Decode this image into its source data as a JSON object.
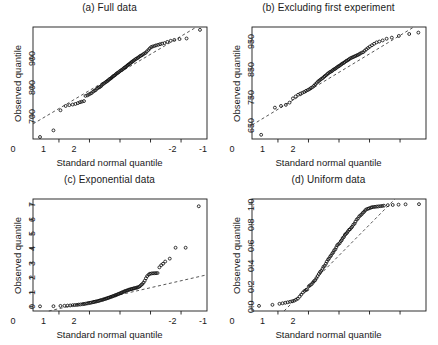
{
  "figure": {
    "width": 438,
    "height": 345,
    "background": "#ffffff",
    "ink_color": "#1a1a1a",
    "point_color": "#111111",
    "line_color": "#444444"
  },
  "chart_data": [
    {
      "id": "panel-a",
      "type": "scatter",
      "title": "(a) Full data",
      "xlabel": "Standard normal quantile",
      "ylabel": "Observed quantile",
      "xticks": [
        -2,
        -1,
        0,
        1,
        2
      ],
      "xticklabels": [
        "-2",
        "-1",
        "0",
        "1",
        "2"
      ],
      "yticks": [
        700,
        800,
        900
      ],
      "yticklabels": [
        "700",
        "800",
        "900"
      ],
      "xlim": [
        -2.85,
        2.85
      ],
      "ylim": [
        620,
        1010
      ],
      "grid": false,
      "legend": null,
      "reference_line": {
        "style": "dashed",
        "intercept": 852,
        "slope": 63
      },
      "x": [
        -2.62,
        -2.18,
        -1.95,
        -1.78,
        -1.66,
        -1.55,
        -1.46,
        -1.38,
        -1.31,
        -1.25,
        -1.18,
        -1.13,
        -1.07,
        -1.02,
        -0.97,
        -0.93,
        -0.88,
        -0.84,
        -0.8,
        -0.76,
        -0.72,
        -0.68,
        -0.65,
        -0.61,
        -0.58,
        -0.54,
        -0.51,
        -0.47,
        -0.44,
        -0.41,
        -0.38,
        -0.35,
        -0.32,
        -0.29,
        -0.26,
        -0.23,
        -0.2,
        -0.17,
        -0.14,
        -0.11,
        -0.08,
        -0.05,
        -0.02,
        0.02,
        0.05,
        0.08,
        0.11,
        0.14,
        0.17,
        0.2,
        0.23,
        0.26,
        0.29,
        0.32,
        0.35,
        0.38,
        0.41,
        0.44,
        0.47,
        0.51,
        0.54,
        0.58,
        0.61,
        0.65,
        0.68,
        0.72,
        0.76,
        0.8,
        0.84,
        0.88,
        0.93,
        0.97,
        1.02,
        1.07,
        1.13,
        1.18,
        1.25,
        1.31,
        1.38,
        1.46,
        1.55,
        1.66,
        1.78,
        1.95,
        2.18,
        2.62
      ],
      "y": [
        627,
        650,
        720,
        735,
        738,
        740,
        742,
        745,
        748,
        750,
        752,
        770,
        772,
        775,
        778,
        780,
        785,
        788,
        790,
        795,
        798,
        800,
        802,
        805,
        810,
        812,
        815,
        818,
        820,
        822,
        825,
        828,
        830,
        832,
        835,
        838,
        840,
        842,
        845,
        848,
        850,
        852,
        855,
        858,
        860,
        862,
        865,
        868,
        870,
        872,
        875,
        878,
        880,
        882,
        885,
        888,
        890,
        892,
        895,
        898,
        900,
        902,
        905,
        908,
        910,
        912,
        915,
        918,
        920,
        925,
        930,
        935,
        940,
        942,
        944,
        946,
        948,
        950,
        952,
        954,
        958,
        962,
        965,
        968,
        970,
        1000
      ]
    },
    {
      "id": "panel-b",
      "type": "scatter",
      "title": "(b) Excluding first experiment",
      "xlabel": "Standard normal quantile",
      "ylabel": "Observed quantile",
      "xticks": [
        -2,
        -1,
        0,
        1,
        2
      ],
      "xticklabels": [
        "-2",
        "-1",
        "0",
        "1",
        "2"
      ],
      "yticks": [
        650,
        750,
        850,
        950
      ],
      "yticklabels": [
        "650",
        "750",
        "850",
        "950"
      ],
      "xlim": [
        -2.85,
        2.85
      ],
      "ylim": [
        600,
        1000
      ],
      "grid": false,
      "legend": null,
      "reference_line": {
        "style": "dashed",
        "intercept": 838,
        "slope": 66
      },
      "x": [
        -2.55,
        -2.1,
        -1.9,
        -1.74,
        -1.62,
        -1.51,
        -1.42,
        -1.34,
        -1.27,
        -1.2,
        -1.14,
        -1.08,
        -1.02,
        -0.97,
        -0.92,
        -0.87,
        -0.82,
        -0.78,
        -0.73,
        -0.69,
        -0.65,
        -0.61,
        -0.57,
        -0.53,
        -0.49,
        -0.46,
        -0.42,
        -0.38,
        -0.35,
        -0.31,
        -0.28,
        -0.24,
        -0.21,
        -0.18,
        -0.14,
        -0.11,
        -0.08,
        -0.04,
        -0.01,
        0.02,
        0.06,
        0.09,
        0.12,
        0.16,
        0.19,
        0.23,
        0.26,
        0.3,
        0.33,
        0.37,
        0.41,
        0.45,
        0.49,
        0.53,
        0.57,
        0.61,
        0.65,
        0.69,
        0.74,
        0.79,
        0.84,
        0.89,
        0.95,
        1.01,
        1.08,
        1.15,
        1.23,
        1.32,
        1.43,
        1.56,
        1.73,
        1.96,
        2.3,
        2.6
      ],
      "y": [
        615,
        712,
        718,
        722,
        730,
        745,
        752,
        758,
        762,
        765,
        768,
        772,
        775,
        778,
        782,
        785,
        790,
        795,
        800,
        805,
        808,
        812,
        815,
        818,
        822,
        825,
        828,
        832,
        835,
        838,
        840,
        842,
        845,
        848,
        850,
        852,
        855,
        858,
        860,
        862,
        865,
        868,
        870,
        872,
        875,
        878,
        880,
        882,
        885,
        888,
        890,
        892,
        894,
        896,
        898,
        900,
        902,
        905,
        908,
        910,
        915,
        920,
        925,
        930,
        935,
        940,
        945,
        948,
        952,
        958,
        962,
        968,
        975,
        980
      ]
    },
    {
      "id": "panel-c",
      "type": "scatter",
      "title": "(c) Exponential data",
      "xlabel": "Standard normal quantile",
      "ylabel": "Observed quantile",
      "xticks": [
        -2,
        -1,
        0,
        1,
        2
      ],
      "xticklabels": [
        "-2",
        "-1",
        "0",
        "1",
        "2"
      ],
      "yticks": [
        0,
        1,
        2,
        3,
        4,
        5,
        6,
        7
      ],
      "yticklabels": [
        "0",
        "1",
        "2",
        "3",
        "4",
        "5",
        "6",
        "7"
      ],
      "xlim": [
        -2.85,
        2.85
      ],
      "ylim": [
        -0.3,
        7.4
      ],
      "grid": false,
      "legend": null,
      "reference_line": {
        "style": "dashed",
        "intercept": 0.82,
        "slope": 0.48
      },
      "x": [
        -2.62,
        -2.18,
        -1.95,
        -1.82,
        -1.72,
        -1.63,
        -1.55,
        -1.48,
        -1.41,
        -1.35,
        -1.29,
        -1.23,
        -1.18,
        -1.13,
        -1.08,
        -1.03,
        -0.98,
        -0.94,
        -0.89,
        -0.85,
        -0.81,
        -0.77,
        -0.73,
        -0.69,
        -0.65,
        -0.61,
        -0.57,
        -0.54,
        -0.5,
        -0.46,
        -0.43,
        -0.39,
        -0.36,
        -0.32,
        -0.29,
        -0.25,
        -0.22,
        -0.18,
        -0.15,
        -0.12,
        -0.08,
        -0.05,
        -0.02,
        0.02,
        0.05,
        0.08,
        0.12,
        0.15,
        0.18,
        0.22,
        0.25,
        0.29,
        0.32,
        0.36,
        0.39,
        0.43,
        0.46,
        0.5,
        0.54,
        0.57,
        0.61,
        0.65,
        0.69,
        0.73,
        0.77,
        0.81,
        0.85,
        0.89,
        0.94,
        0.98,
        1.03,
        1.08,
        1.13,
        1.18,
        1.23,
        1.29,
        1.35,
        1.41,
        1.48,
        1.63,
        1.82,
        2.15,
        2.58
      ],
      "y": [
        0.02,
        0.03,
        0.05,
        0.06,
        0.07,
        0.08,
        0.1,
        0.11,
        0.12,
        0.14,
        0.15,
        0.17,
        0.18,
        0.2,
        0.22,
        0.24,
        0.26,
        0.28,
        0.3,
        0.32,
        0.34,
        0.36,
        0.38,
        0.4,
        0.43,
        0.45,
        0.47,
        0.5,
        0.52,
        0.55,
        0.57,
        0.6,
        0.62,
        0.65,
        0.68,
        0.7,
        0.73,
        0.76,
        0.78,
        0.81,
        0.84,
        0.87,
        0.9,
        0.93,
        0.96,
        0.99,
        1.02,
        1.05,
        1.08,
        1.1,
        1.13,
        1.16,
        1.18,
        1.2,
        1.22,
        1.24,
        1.26,
        1.28,
        1.3,
        1.32,
        1.35,
        1.4,
        1.48,
        1.55,
        1.65,
        1.78,
        1.95,
        2.1,
        2.2,
        2.26,
        2.28,
        2.29,
        2.3,
        2.3,
        2.31,
        2.7,
        2.85,
        2.95,
        3.1,
        3.3,
        4.05,
        4.05,
        6.9
      ]
    },
    {
      "id": "panel-d",
      "type": "scatter",
      "title": "(d) Uniform data",
      "xlabel": "Standard normal quantile",
      "ylabel": "Observed quantile",
      "xticks": [
        -2,
        -1,
        0,
        1,
        2
      ],
      "xticklabels": [
        "-2",
        "-1",
        "0",
        "1",
        "2"
      ],
      "yticks": [
        0.0,
        0.2,
        0.4,
        0.6,
        0.8,
        1.0
      ],
      "yticklabels": [
        "0.0",
        "0.2",
        "0.4",
        "0.6",
        "0.8",
        "1.0"
      ],
      "xlim": [
        -2.85,
        2.85
      ],
      "ylim": [
        -0.04,
        1.05
      ],
      "grid": false,
      "legend": null,
      "reference_line": {
        "style": "dashed",
        "intercept": 0.5,
        "slope": 0.3
      },
      "x": [
        -2.62,
        -2.18,
        -1.95,
        -1.85,
        -1.76,
        -1.68,
        -1.6,
        -1.53,
        -1.47,
        -1.41,
        -1.35,
        -1.29,
        -1.24,
        -1.18,
        -1.13,
        -1.08,
        -1.04,
        -0.99,
        -0.95,
        -0.9,
        -0.86,
        -0.82,
        -0.78,
        -0.74,
        -0.7,
        -0.66,
        -0.62,
        -0.58,
        -0.54,
        -0.51,
        -0.47,
        -0.43,
        -0.4,
        -0.36,
        -0.33,
        -0.29,
        -0.26,
        -0.22,
        -0.19,
        -0.16,
        -0.12,
        -0.09,
        -0.06,
        -0.02,
        0.02,
        0.06,
        0.09,
        0.12,
        0.16,
        0.19,
        0.22,
        0.26,
        0.29,
        0.33,
        0.36,
        0.4,
        0.43,
        0.47,
        0.51,
        0.54,
        0.58,
        0.62,
        0.66,
        0.7,
        0.74,
        0.78,
        0.82,
        0.86,
        0.9,
        0.95,
        0.99,
        1.04,
        1.08,
        1.13,
        1.18,
        1.24,
        1.29,
        1.35,
        1.41,
        1.47,
        1.6,
        1.76,
        1.95,
        2.18,
        2.62
      ],
      "y": [
        0.01,
        0.02,
        0.03,
        0.035,
        0.04,
        0.045,
        0.05,
        0.055,
        0.06,
        0.07,
        0.08,
        0.1,
        0.12,
        0.14,
        0.155,
        0.165,
        0.17,
        0.2,
        0.21,
        0.22,
        0.235,
        0.25,
        0.26,
        0.28,
        0.3,
        0.32,
        0.34,
        0.35,
        0.37,
        0.39,
        0.4,
        0.42,
        0.44,
        0.46,
        0.47,
        0.49,
        0.5,
        0.52,
        0.53,
        0.55,
        0.56,
        0.58,
        0.6,
        0.61,
        0.62,
        0.64,
        0.65,
        0.67,
        0.68,
        0.7,
        0.71,
        0.72,
        0.735,
        0.75,
        0.755,
        0.77,
        0.78,
        0.8,
        0.81,
        0.83,
        0.85,
        0.86,
        0.88,
        0.89,
        0.9,
        0.915,
        0.925,
        0.94,
        0.95,
        0.955,
        0.96,
        0.965,
        0.97,
        0.972,
        0.974,
        0.976,
        0.978,
        0.98,
        0.982,
        0.985,
        0.99,
        0.992,
        0.995,
        0.998,
        1.0
      ]
    }
  ]
}
